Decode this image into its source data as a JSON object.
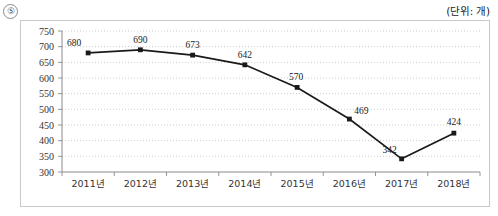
{
  "question_number": "⑤",
  "unit_note": "(단위: 개)",
  "chart_data": {
    "type": "line",
    "title": "",
    "subtitle": "",
    "xlabel": "",
    "ylabel": "",
    "unit": "개",
    "categories": [
      "2011년",
      "2012년",
      "2013년",
      "2014년",
      "2015년",
      "2016년",
      "2017년",
      "2018년"
    ],
    "values": [
      680,
      690,
      673,
      642,
      570,
      469,
      342,
      424
    ],
    "data_labels": [
      "680",
      "690",
      "673",
      "642",
      "570",
      "469",
      "342",
      "424"
    ],
    "ylim": [
      300,
      750
    ],
    "ytick_step": 50,
    "yticks": [
      "750",
      "700",
      "650",
      "600",
      "550",
      "500",
      "450",
      "400",
      "350",
      "300"
    ],
    "grid": true,
    "grid_style": "dotted",
    "legend": "none",
    "marker": "square",
    "line_color": "#1a1a1a",
    "grid_color": "#c0c0c0",
    "axis_color": "#8a8a8a"
  }
}
